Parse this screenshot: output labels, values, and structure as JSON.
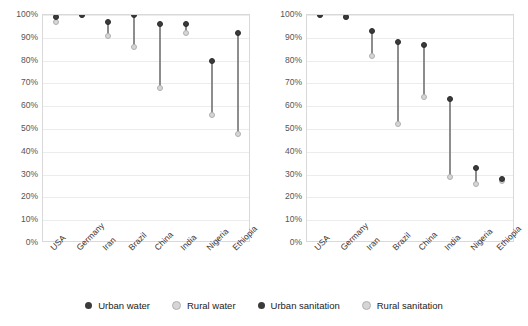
{
  "legend": {
    "position": "bottom",
    "items": [
      {
        "label": "Urban water",
        "color": "#3b3b3b",
        "icon": "legend-dot-icon"
      },
      {
        "label": "Rural water",
        "color": "#d6d6d6",
        "icon": "legend-dot-icon"
      },
      {
        "label": "Urban sanitation",
        "color": "#3b3b3b",
        "icon": "legend-dot-icon"
      },
      {
        "label": "Rural sanitation",
        "color": "#d6d6d6",
        "icon": "legend-dot-icon"
      }
    ]
  },
  "axis": {
    "yticks": [
      "100%",
      "90%",
      "80%",
      "70%",
      "60%",
      "50%",
      "40%",
      "30%",
      "20%",
      "10%",
      "0%"
    ],
    "ytick_values": [
      100,
      90,
      80,
      70,
      60,
      50,
      40,
      30,
      20,
      10,
      0
    ]
  },
  "chart_data": [
    {
      "type": "scatter",
      "title": "",
      "xlabel": "",
      "ylabel": "",
      "ylim": [
        0,
        100
      ],
      "grid": true,
      "legend_position": "bottom",
      "categories": [
        "USA",
        "Germany",
        "Iran",
        "Brazil",
        "China",
        "India",
        "Nigeria",
        "Ethiopia"
      ],
      "series": [
        {
          "name": "Urban water",
          "color": "#3b3b3b",
          "values": [
            99,
            100,
            97,
            100,
            96,
            96,
            80,
            92
          ]
        },
        {
          "name": "Rural water",
          "color": "#d6d6d6",
          "values": [
            97,
            100,
            91,
            86,
            68,
            92,
            56,
            48
          ]
        }
      ]
    },
    {
      "type": "scatter",
      "title": "",
      "xlabel": "",
      "ylabel": "",
      "ylim": [
        0,
        100
      ],
      "grid": true,
      "legend_position": "bottom",
      "categories": [
        "USA",
        "Germany",
        "Iran",
        "Brazil",
        "China",
        "India",
        "Nigeria",
        "Ethiopia"
      ],
      "series": [
        {
          "name": "Urban sanitation",
          "color": "#3b3b3b",
          "values": [
            100,
            99,
            93,
            88,
            87,
            63,
            33,
            28
          ]
        },
        {
          "name": "Rural sanitation",
          "color": "#d6d6d6",
          "values": [
            100,
            99,
            82,
            52,
            64,
            29,
            26,
            27
          ]
        }
      ]
    }
  ]
}
